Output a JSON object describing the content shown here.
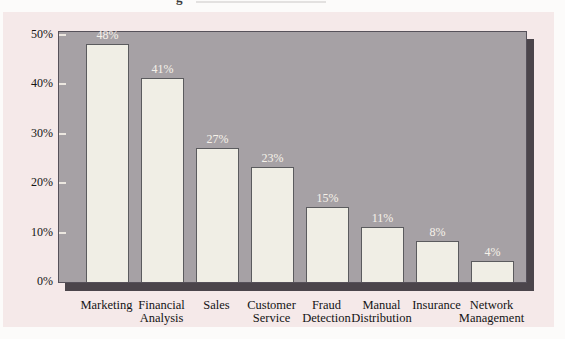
{
  "page": {
    "cropped_caption_fragment": "g"
  },
  "chart_data": {
    "type": "bar",
    "title": "",
    "xlabel": "",
    "ylabel": "",
    "categories": [
      "Marketing",
      "Financial Analysis",
      "Sales",
      "Customer Service",
      "Fraud Detection",
      "Manual Distribution",
      "Insurance",
      "Network Management"
    ],
    "values": [
      48,
      41,
      27,
      23,
      15,
      11,
      8,
      4
    ],
    "data_labels": [
      "48%",
      "41%",
      "27%",
      "23%",
      "15%",
      "11%",
      "8%",
      "4%"
    ],
    "y_ticks": [
      {
        "label": "50%",
        "value": 50
      },
      {
        "label": "40%",
        "value": 40
      },
      {
        "label": "30%",
        "value": 30
      },
      {
        "label": "20%",
        "value": 20
      },
      {
        "label": "10%",
        "value": 10
      },
      {
        "label": "0%",
        "value": 0
      }
    ],
    "ylim": [
      0,
      51
    ],
    "grid": false,
    "legend": "none",
    "colors": {
      "card_background": "#f5e9e9",
      "plot_background": "#a6a1a5",
      "plot_shadow": "#4b454b",
      "bar_fill": "#f0eee5",
      "bar_border": "#5b5b5e",
      "value_label_text": "#f6f2ea",
      "axis_text": "#141414",
      "tick_mark": "#ece7e0"
    }
  }
}
